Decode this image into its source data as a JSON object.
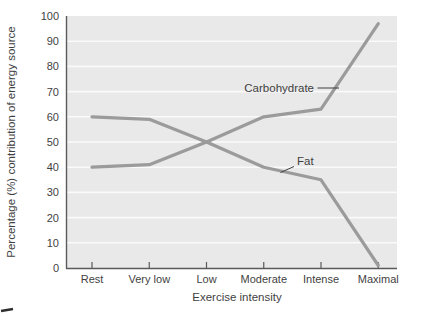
{
  "chart_data": {
    "type": "line",
    "categories": [
      "Rest",
      "Very low",
      "Low",
      "Moderate",
      "Intense",
      "Maximal"
    ],
    "series": [
      {
        "name": "Carbohydrate",
        "values": [
          40,
          41,
          50,
          60,
          63,
          97
        ]
      },
      {
        "name": "Fat",
        "values": [
          60,
          59,
          50,
          40,
          35,
          1
        ]
      }
    ],
    "title": "",
    "xlabel": "Exercise intensity",
    "ylabel": "Percentage (%) contribution of energy source",
    "ylim": [
      0,
      100
    ],
    "y_ticks": [
      0,
      10,
      20,
      30,
      40,
      50,
      60,
      70,
      80,
      90,
      100
    ],
    "grid": "horizontal white gridlines every 10 units",
    "legend": "none; inline series labels with leader lines",
    "colors": {
      "line": "#9b9b9b",
      "plot_background": "#e9e9e9",
      "gridline": "#fafafa",
      "axis": "#5a5a5a",
      "text": "#3f3f3f"
    }
  }
}
